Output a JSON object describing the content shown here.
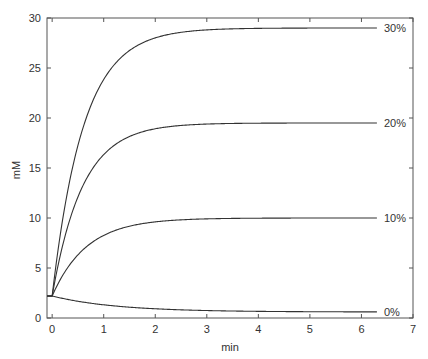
{
  "chart_data": {
    "type": "line",
    "title": "",
    "xlabel": "min",
    "ylabel": "mM",
    "xlim": [
      -0.1,
      7
    ],
    "ylim": [
      0,
      30
    ],
    "xticks": [
      0,
      1,
      2,
      3,
      4,
      5,
      6,
      7
    ],
    "yticks": [
      0,
      5,
      10,
      15,
      20,
      25,
      30
    ],
    "grid": false,
    "legend_position": "inline-right",
    "x": [
      -0.1,
      0,
      0.25,
      0.5,
      0.75,
      1,
      1.5,
      2,
      2.5,
      3,
      4,
      5,
      6,
      6.3
    ],
    "series": [
      {
        "name": "30%",
        "label": "30%",
        "values": [
          2.2,
          2.2,
          10.8,
          16.7,
          20.9,
          23.8,
          26.7,
          28.0,
          28.6,
          28.8,
          29.0,
          29.0,
          29.0,
          29.0
        ]
      },
      {
        "name": "20%",
        "label": "20%",
        "values": [
          2.2,
          2.2,
          8.3,
          12.4,
          15.0,
          16.7,
          18.3,
          19.0,
          19.3,
          19.4,
          19.5,
          19.5,
          19.5,
          19.5
        ]
      },
      {
        "name": "10%",
        "label": "10%",
        "values": [
          2.2,
          2.2,
          4.7,
          6.5,
          7.6,
          8.3,
          9.2,
          9.6,
          9.8,
          9.9,
          10.0,
          10.0,
          10.0,
          10.0
        ]
      },
      {
        "name": "0%",
        "label": "0%",
        "values": [
          2.2,
          2.2,
          2.1,
          1.9,
          1.8,
          1.7,
          1.3,
          1.0,
          0.8,
          0.7,
          0.6,
          0.6,
          0.6,
          0.6
        ]
      }
    ],
    "model": [
      {
        "plateau": 29.0,
        "start": 2.2,
        "k": 1.65
      },
      {
        "plateau": 19.5,
        "start": 2.2,
        "k": 1.7
      },
      {
        "plateau": 10.0,
        "start": 2.2,
        "k": 1.5
      },
      {
        "plateau": 0.6,
        "start": 2.2,
        "k": 0.8
      }
    ],
    "line_end_x": 6.3,
    "line_color": "#333333",
    "axis_color": "#555555"
  }
}
